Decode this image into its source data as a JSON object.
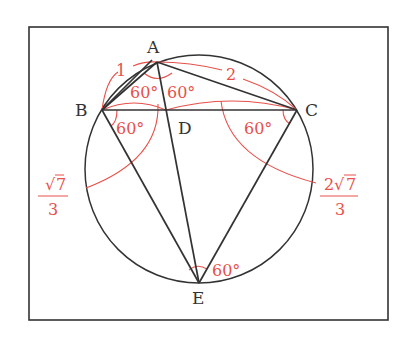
{
  "diagram": {
    "type": "geometry",
    "frame": {
      "x": 29,
      "y": 27,
      "width": 359,
      "height": 293
    },
    "colors": {
      "line": "#333333",
      "annotation": "#e8504a",
      "background": "#ffffff"
    },
    "circle": {
      "cx": 199,
      "cy": 169,
      "r": 114
    },
    "points": {
      "A": {
        "label": "A",
        "x": 157,
        "y": 62
      },
      "B": {
        "label": "B",
        "x": 102,
        "y": 110
      },
      "C": {
        "label": "C",
        "x": 297,
        "y": 110
      },
      "D": {
        "label": "D",
        "x": 166,
        "y": 110
      },
      "E": {
        "label": "E",
        "x": 199,
        "y": 283
      }
    },
    "segments": [
      "AB",
      "AC",
      "BC",
      "AE",
      "BE",
      "CE"
    ],
    "lengths": {
      "AB": "1",
      "AC": "2",
      "BD": {
        "numerator_coef": "",
        "radicand": "7",
        "denominator": "3"
      },
      "DC": {
        "numerator_coef": "2",
        "radicand": "7",
        "denominator": "3"
      }
    },
    "angles": {
      "BAD": "60°",
      "DAC": "60°",
      "DBE": "60°",
      "BCE": "60°",
      "BEC": "60°"
    }
  }
}
